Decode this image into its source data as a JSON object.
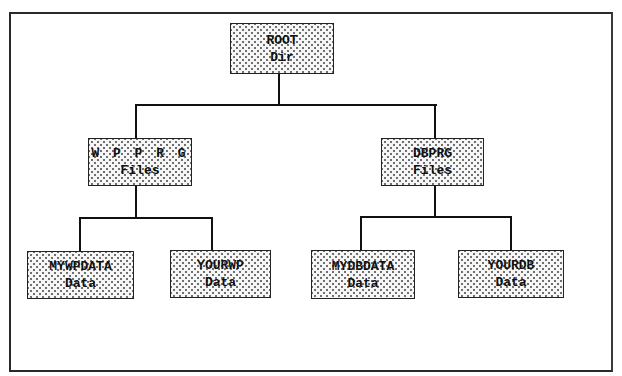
{
  "diagram": {
    "type": "directory-tree",
    "root": {
      "line1": "ROOT",
      "line2": "Dir"
    },
    "level2": [
      {
        "id": "wpprg",
        "line1": "W P P R G",
        "line2": "Files"
      },
      {
        "id": "dbprg",
        "line1": "DBPRG",
        "line2": "Files"
      }
    ],
    "leaves": [
      {
        "parent": "wpprg",
        "line1": "MYWPDATA",
        "line2": "Data"
      },
      {
        "parent": "wpprg",
        "line1": "YOURWP",
        "line2": "Data"
      },
      {
        "parent": "dbprg",
        "line1": "MYDBDATA",
        "line2": "Data"
      },
      {
        "parent": "dbprg",
        "line1": "YOURDB",
        "line2": "Data"
      }
    ],
    "colors": {
      "line": "#111111",
      "box_border": "#222222",
      "box_fill": "#f6f6f6",
      "dot": "#6a6a6a"
    }
  }
}
